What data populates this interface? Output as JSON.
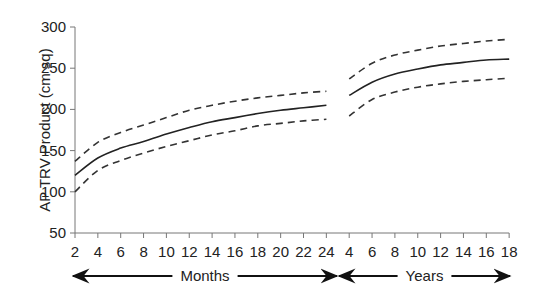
{
  "chart_data": {
    "type": "line",
    "title": "",
    "ylabel": "AP TRV Product (cm sq)",
    "xlabel": "",
    "ylim": [
      50,
      300
    ],
    "yticks": [
      50,
      100,
      150,
      200,
      250,
      300
    ],
    "grid": false,
    "legend": null,
    "x_segments": [
      {
        "name": "Months",
        "unit": "months",
        "ticks": [
          2,
          4,
          6,
          8,
          10,
          12,
          14,
          16,
          18,
          20,
          22,
          24
        ],
        "arrow_label": "Months"
      },
      {
        "name": "Years",
        "unit": "years",
        "ticks": [
          4,
          6,
          8,
          10,
          12,
          14,
          16,
          18
        ],
        "arrow_label": "Years"
      }
    ],
    "categories": [
      "2m",
      "4m",
      "6m",
      "8m",
      "10m",
      "12m",
      "14m",
      "16m",
      "18m",
      "20m",
      "22m",
      "24m",
      "4y",
      "6y",
      "8y",
      "10y",
      "12y",
      "14y",
      "16y",
      "18y"
    ],
    "series": [
      {
        "name": "Upper bound",
        "style": "dashed",
        "segments": [
          {
            "segment": "Months",
            "x": [
              2,
              4,
              6,
              8,
              10,
              12,
              14,
              16,
              18,
              20,
              22,
              24
            ],
            "values": [
              137,
              160,
              172,
              181,
              190,
              199,
              205,
              210,
              214,
              217,
              220,
              222
            ]
          },
          {
            "segment": "Years",
            "x": [
              4,
              6,
              8,
              10,
              12,
              14,
              16,
              18
            ],
            "values": [
              237,
              256,
              266,
              272,
              277,
              280,
              283,
              285
            ]
          }
        ]
      },
      {
        "name": "Mean",
        "style": "solid",
        "segments": [
          {
            "segment": "Months",
            "x": [
              2,
              4,
              6,
              8,
              10,
              12,
              14,
              16,
              18,
              20,
              22,
              24
            ],
            "values": [
              120,
              141,
              153,
              161,
              170,
              178,
              185,
              190,
              195,
              199,
              202,
              205
            ]
          },
          {
            "segment": "Years",
            "x": [
              4,
              6,
              8,
              10,
              12,
              14,
              16,
              18
            ],
            "values": [
              217,
              233,
              243,
              249,
              254,
              257,
              260,
              261
            ]
          }
        ]
      },
      {
        "name": "Lower bound",
        "style": "dashed",
        "segments": [
          {
            "segment": "Months",
            "x": [
              2,
              4,
              6,
              8,
              10,
              12,
              14,
              16,
              18,
              20,
              22,
              24
            ],
            "values": [
              100,
              126,
              138,
              147,
              155,
              162,
              169,
              174,
              180,
              183,
              186,
              188
            ]
          },
          {
            "segment": "Years",
            "x": [
              4,
              6,
              8,
              10,
              12,
              14,
              16,
              18
            ],
            "values": [
              192,
              212,
              221,
              227,
              231,
              234,
              236,
              238
            ]
          }
        ]
      }
    ]
  }
}
